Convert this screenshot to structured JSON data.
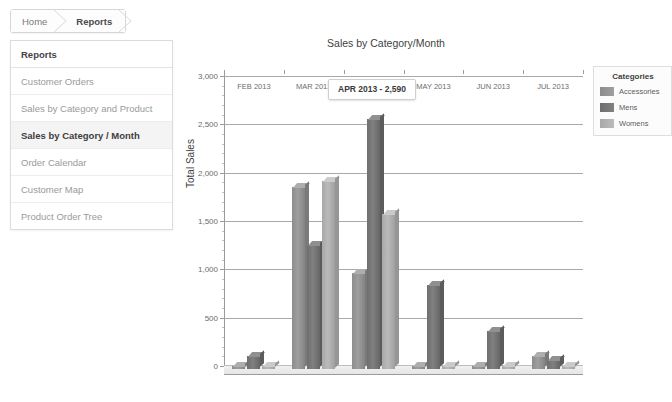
{
  "breadcrumb": {
    "items": [
      {
        "label": "Home",
        "current": false
      },
      {
        "label": "Reports",
        "current": true
      }
    ]
  },
  "sidebar": {
    "header": "Reports",
    "items": [
      {
        "label": "Customer Orders",
        "selected": false
      },
      {
        "label": "Sales by Category and Product",
        "selected": false
      },
      {
        "label": "Sales by Category / Month",
        "selected": true
      },
      {
        "label": "Order Calendar",
        "selected": false
      },
      {
        "label": "Customer Map",
        "selected": false
      },
      {
        "label": "Product Order Tree",
        "selected": false
      }
    ]
  },
  "tooltip": {
    "text": "APR 2013 - 2,590"
  },
  "legend": {
    "title": "Categories"
  },
  "chart_data": {
    "type": "bar",
    "title": "Sales by Category/Month",
    "xlabel": "",
    "ylabel": "Total Sales",
    "ylim": [
      0,
      3000
    ],
    "ytick_labels": [
      "0",
      "500",
      "1,000",
      "1,500",
      "2,000",
      "2,500",
      "3,000"
    ],
    "ytick_values": [
      0,
      500,
      1000,
      1500,
      2000,
      2500,
      3000
    ],
    "grid": true,
    "legend_position": "right",
    "categories": [
      "FEB 2013",
      "MAR 2013",
      "APR 2013",
      "MAY 2013",
      "JUN 2013",
      "JUL 2013"
    ],
    "series": [
      {
        "name": "Accessories",
        "color": "#8c8c8c",
        "values": [
          20,
          1880,
          990,
          30,
          20,
          130
        ]
      },
      {
        "name": "Mens",
        "color": "#6e6e6e",
        "values": [
          130,
          1280,
          2590,
          870,
          390,
          90
        ]
      },
      {
        "name": "Womens",
        "color": "#a8a8a8",
        "values": [
          20,
          1950,
          1600,
          30,
          20,
          20
        ]
      }
    ]
  }
}
